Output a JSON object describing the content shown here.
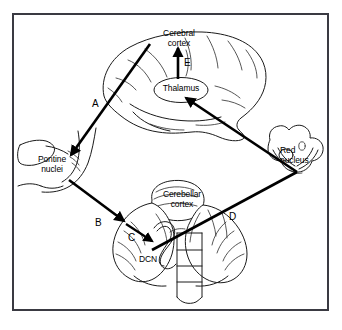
{
  "figure": {
    "border_color": "#3a3a42",
    "background_color": "#ffffff",
    "ink_color": "#1a1a1a"
  },
  "structures": [
    {
      "id": "cerebral-cortex",
      "label": "Cerebral\ncortex"
    },
    {
      "id": "thalamus",
      "label": "Thalamus"
    },
    {
      "id": "pontine-nuclei",
      "label": "Pontine\nnuclei"
    },
    {
      "id": "red-nucleus",
      "label": "Red\nnucleus"
    },
    {
      "id": "cerebellar-cortex",
      "label": "Cerebellar\ncortex"
    },
    {
      "id": "dcn",
      "label": "DCN"
    }
  ],
  "labels": {
    "cerebral_cortex": "Cerebral\ncortex",
    "thalamus": "Thalamus",
    "pontine_nuclei": "Pontine\nnuclei",
    "red_nucleus": "Red\nnucleus",
    "cerebellar_cortex": "Cerebellar\ncortex",
    "dcn": "DCN"
  },
  "pathways": [
    {
      "key": "A",
      "letter": "A",
      "from": "Cerebral cortex",
      "to": "Pontine nuclei"
    },
    {
      "key": "B",
      "letter": "B",
      "from": "Pontine nuclei",
      "to": "Cerebellar cortex"
    },
    {
      "key": "C",
      "letter": "C",
      "from": "Cerebellar cortex",
      "to": "DCN"
    },
    {
      "key": "D",
      "letter": "D",
      "from": "DCN",
      "to": "Red nucleus"
    },
    {
      "key": "E",
      "letter": "E",
      "from": "Thalamus",
      "to": "Cerebral cortex"
    },
    {
      "key": "F",
      "letter": "",
      "from": "Red nucleus",
      "to": "Thalamus"
    }
  ],
  "pathway_letters": {
    "a": "A",
    "b": "B",
    "c": "C",
    "d": "D",
    "e": "E"
  }
}
